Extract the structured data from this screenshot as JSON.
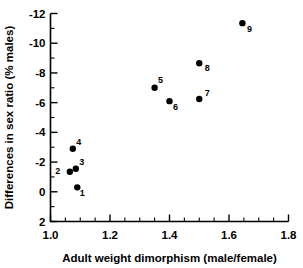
{
  "title": {
    "text": "HAS BEEN IN THE MONKEY/AS",
    "clipped": true
  },
  "chart_data": {
    "type": "scatter",
    "title": "",
    "xlabel": "Adult weight dimorphism (male/female)",
    "ylabel": "Differences in sex ratio (% males)",
    "xlim": [
      1.0,
      1.8
    ],
    "ylim": [
      2,
      -12
    ],
    "y_axis_inverted": true,
    "grid": false,
    "legend": "none",
    "x_ticks": [
      1.0,
      1.2,
      1.4,
      1.6,
      1.8
    ],
    "x_tick_labels": [
      "1.0",
      "1.2",
      "1.4",
      "1.6",
      "1.8"
    ],
    "x_minor_step": 0.05,
    "y_ticks": [
      -12,
      -10,
      -8,
      -6,
      -4,
      -2,
      0,
      2
    ],
    "y_tick_labels": [
      "-12",
      "-10",
      "-8",
      "-6",
      "-4",
      "-2",
      "0",
      "2"
    ],
    "y_minor_step": 1,
    "marker_color": "#000000",
    "marker_size": 4,
    "points": [
      {
        "label": "1",
        "x": 1.09,
        "y": -0.3,
        "label_dx": 5,
        "label_dy": 9
      },
      {
        "label": "2",
        "x": 1.065,
        "y": -1.35,
        "label_dx": -12,
        "label_dy": 2
      },
      {
        "label": "3",
        "x": 1.085,
        "y": -1.55,
        "label_dx": 6,
        "label_dy": -4
      },
      {
        "label": "4",
        "x": 1.075,
        "y": -2.9,
        "label_dx": 6,
        "label_dy": -4
      },
      {
        "label": "5",
        "x": 1.35,
        "y": -7.0,
        "label_dx": 6,
        "label_dy": -5
      },
      {
        "label": "6",
        "x": 1.4,
        "y": -6.1,
        "label_dx": 6,
        "label_dy": 9
      },
      {
        "label": "7",
        "x": 1.5,
        "y": -6.25,
        "label_dx": 8,
        "label_dy": -3
      },
      {
        "label": "8",
        "x": 1.5,
        "y": -8.65,
        "label_dx": 8,
        "label_dy": 8
      },
      {
        "label": "9",
        "x": 1.645,
        "y": -11.35,
        "label_dx": 7,
        "label_dy": 9
      }
    ]
  }
}
